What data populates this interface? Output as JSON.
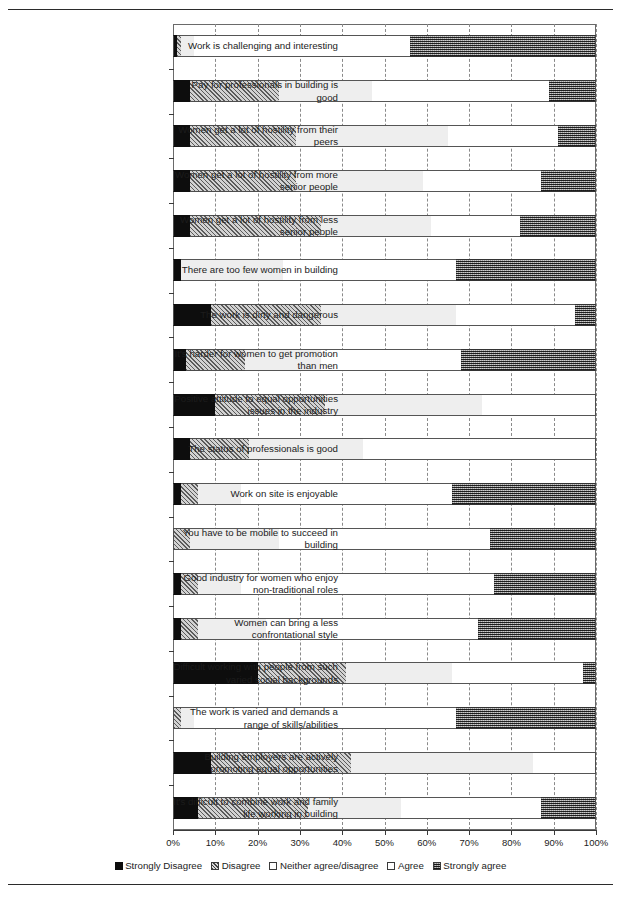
{
  "chart_data": {
    "type": "bar",
    "subtype": "stacked-horizontal-100",
    "title": "",
    "xlabel": "",
    "ylabel": "",
    "xlim": [
      0,
      100
    ],
    "xtick_labels": [
      "0%",
      "10%",
      "20%",
      "30%",
      "40%",
      "50%",
      "60%",
      "70%",
      "80%",
      "90%",
      "100%"
    ],
    "xticks": [
      0,
      10,
      20,
      30,
      40,
      50,
      60,
      70,
      80,
      90,
      100
    ],
    "grid": true,
    "legend_position": "bottom",
    "series": [
      {
        "name": "Strongly Disagree",
        "key": "sd",
        "color": "#0d0d0d",
        "pattern": "solid-black"
      },
      {
        "name": "Disagree",
        "key": "dg",
        "color": "#d2d2d2",
        "pattern": "diagonal-hatch"
      },
      {
        "name": "Neither agree/disagree",
        "key": "nt",
        "color": "#eeeeee",
        "pattern": "light-fill"
      },
      {
        "name": "Agree",
        "key": "ag",
        "color": "#ffffff",
        "pattern": "white"
      },
      {
        "name": "Strongly agree",
        "key": "sa",
        "color": "#8e8e8e",
        "pattern": "dense-grid"
      }
    ],
    "categories": [
      "Work is challenging and interesting",
      "Pay for professionals in building is good",
      "Women get a lot of hostility from their peers",
      "Women get a lot of hostility from more senior people",
      "Women get a lot of hostility from less senior people",
      "There are too few women in building",
      "The work is dirty and dangerous",
      "It's harder for women to get promotion than men",
      "Positive attitude to equal opportunities issues in the industry",
      "The status of professionals is good",
      "Work on site is enjoyable",
      "You have to be mobile to succeed in building",
      "Good industry for women who enjoy non-traditional roles",
      "Women can bring a less confrontational style",
      "Difficult working with people from such varied social backgrounds",
      "The work is varied and demands a range of skills/abilities",
      "Building employers are actively promoting equal opportunities",
      "It's difficult to combine work and family life working in building"
    ],
    "rows": [
      {
        "label": "Work is challenging and interesting",
        "values": [
          1,
          1,
          3,
          51,
          44
        ]
      },
      {
        "label": "Pay for professionals in building is good",
        "values": [
          4,
          21,
          22,
          42,
          11
        ]
      },
      {
        "label": "Women get a lot of hostility from their peers",
        "values": [
          4,
          25,
          36,
          26,
          9
        ]
      },
      {
        "label": "Women get a lot of hostility from more senior people",
        "values": [
          4,
          25,
          30,
          28,
          13
        ]
      },
      {
        "label": "Women get a lot of hostility from less senior people",
        "values": [
          4,
          31,
          26,
          21,
          18
        ]
      },
      {
        "label": "There are too few women in building",
        "values": [
          2,
          0,
          24,
          41,
          33
        ]
      },
      {
        "label": "The work is dirty and dangerous",
        "values": [
          9,
          26,
          32,
          28,
          5
        ]
      },
      {
        "label": "It's harder for women to get promotion than men",
        "values": [
          3,
          14,
          18,
          33,
          32
        ]
      },
      {
        "label": "Positive attitude to equal opportunities issues in the industry",
        "values": [
          10,
          26,
          37,
          27,
          0
        ]
      },
      {
        "label": "The status of professionals is good",
        "values": [
          4,
          14,
          27,
          55,
          0
        ]
      },
      {
        "label": "Work on site is enjoyable",
        "values": [
          2,
          4,
          10,
          50,
          34
        ]
      },
      {
        "label": "You have to be mobile to succeed in building",
        "values": [
          0,
          4,
          21,
          50,
          25
        ]
      },
      {
        "label": "Good industry for women who enjoy non-traditional roles",
        "values": [
          2,
          4,
          10,
          60,
          24
        ]
      },
      {
        "label": "Women can bring a less confrontational style",
        "values": [
          2,
          4,
          16,
          50,
          28
        ]
      },
      {
        "label": "Difficult working with people from such varied social backgrounds",
        "values": [
          20,
          21,
          25,
          31,
          3
        ]
      },
      {
        "label": "The work is varied and demands a range of skills/abilities",
        "values": [
          0,
          2,
          3,
          62,
          33
        ]
      },
      {
        "label": "Building employers are actively promoting equal opportunities",
        "values": [
          9,
          33,
          43,
          15,
          0
        ]
      },
      {
        "label": "It's difficult to combine work and family life working in building",
        "values": [
          6,
          26,
          22,
          33,
          13
        ]
      }
    ]
  },
  "legend": {
    "items": [
      {
        "label": "Strongly Disagree"
      },
      {
        "label": "Disagree"
      },
      {
        "label": "Neither agree/disagree"
      },
      {
        "label": "Agree"
      },
      {
        "label": "Strongly agree"
      }
    ]
  }
}
